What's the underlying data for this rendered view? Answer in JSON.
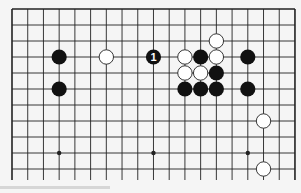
{
  "board": {
    "size": 19,
    "visible_rows": 11,
    "open_bottom_edge": true,
    "colors": {
      "background": "#f5f5f5",
      "line": "#222222",
      "black_stone": "#111111",
      "white_stone": "#ffffff",
      "white_stone_outline": "#222222",
      "move_label": "#ffffff"
    },
    "star_points": [
      {
        "col": 3,
        "row": 9
      },
      {
        "col": 9,
        "row": 9
      },
      {
        "col": 15,
        "row": 9
      }
    ],
    "stones": [
      {
        "color": "black",
        "col": 3,
        "row": 3
      },
      {
        "color": "black",
        "col": 3,
        "row": 5
      },
      {
        "color": "white",
        "col": 6,
        "row": 3
      },
      {
        "color": "black",
        "col": 9,
        "row": 3,
        "label": "1"
      },
      {
        "color": "white",
        "col": 13,
        "row": 2
      },
      {
        "color": "white",
        "col": 11,
        "row": 3
      },
      {
        "color": "black",
        "col": 12,
        "row": 3
      },
      {
        "color": "white",
        "col": 13,
        "row": 3
      },
      {
        "color": "black",
        "col": 15,
        "row": 3
      },
      {
        "color": "white",
        "col": 11,
        "row": 4
      },
      {
        "color": "white",
        "col": 12,
        "row": 4
      },
      {
        "color": "black",
        "col": 13,
        "row": 4
      },
      {
        "color": "black",
        "col": 11,
        "row": 5
      },
      {
        "color": "black",
        "col": 12,
        "row": 5
      },
      {
        "color": "black",
        "col": 13,
        "row": 5
      },
      {
        "color": "black",
        "col": 15,
        "row": 5
      },
      {
        "color": "white",
        "col": 16,
        "row": 7
      },
      {
        "color": "white",
        "col": 16,
        "row": 10
      }
    ]
  }
}
